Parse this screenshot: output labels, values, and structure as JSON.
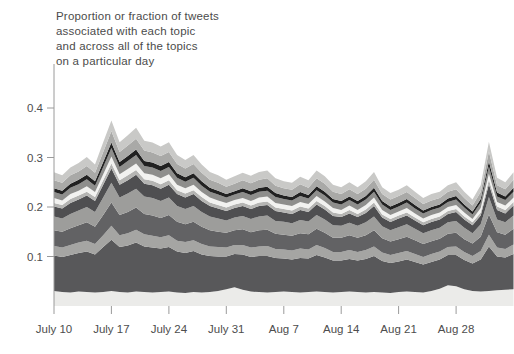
{
  "title": {
    "lines": [
      "Proportion or fraction of tweets",
      "associated with each topic",
      "and across all of the topics",
      "on a particular day"
    ]
  },
  "colors": {
    "background": "#ffffff",
    "axis": "#9a9a9a",
    "tick_label": "#4d4d4d",
    "title_text": "#4b4b4b"
  },
  "chart_data": {
    "type": "area",
    "stacked": true,
    "title": "Proportion or fraction of tweets associated with each topic and across all of the topics on a particular day",
    "xlabel": "",
    "ylabel": "",
    "grid": false,
    "legend_position": "none",
    "ylim": [
      0,
      0.42
    ],
    "yticks": {
      "values": [
        0.1,
        0.2,
        0.3,
        0.4
      ],
      "labels": [
        "0.1",
        "0.2",
        "0.3",
        "0.4"
      ]
    },
    "xticks": {
      "indices": [
        0,
        7,
        14,
        21,
        28,
        35,
        42,
        49
      ],
      "labels": [
        "July 10",
        "July 17",
        "July 24",
        "July 31",
        "Aug 7",
        "Aug 14",
        "Aug 21",
        "Aug 28"
      ]
    },
    "values_unit": "thousandths (divide by 1000 for proportion)",
    "x": [
      "July 10",
      "July 11",
      "July 12",
      "July 13",
      "July 14",
      "July 15",
      "July 16",
      "July 17",
      "July 18",
      "July 19",
      "July 20",
      "July 21",
      "July 22",
      "July 23",
      "July 24",
      "July 25",
      "July 26",
      "July 27",
      "July 28",
      "July 29",
      "July 30",
      "July 31",
      "Aug 1",
      "Aug 2",
      "Aug 3",
      "Aug 4",
      "Aug 5",
      "Aug 6",
      "Aug 7",
      "Aug 8",
      "Aug 9",
      "Aug 10",
      "Aug 11",
      "Aug 12",
      "Aug 13",
      "Aug 14",
      "Aug 15",
      "Aug 16",
      "Aug 17",
      "Aug 18",
      "Aug 19",
      "Aug 20",
      "Aug 21",
      "Aug 22",
      "Aug 23",
      "Aug 24",
      "Aug 25",
      "Aug 26",
      "Aug 27",
      "Aug 28",
      "Aug 29",
      "Aug 30",
      "Aug 31",
      "Sep 1",
      "Sep 2",
      "Sep 3",
      "Sep 4"
    ],
    "series": [
      {
        "name": "topic-band-01-bottom",
        "color": "#ebebe9",
        "values": [
          30,
          28,
          27,
          29,
          28,
          27,
          28,
          30,
          28,
          27,
          29,
          28,
          27,
          28,
          29,
          27,
          26,
          28,
          27,
          28,
          30,
          34,
          38,
          33,
          29,
          28,
          27,
          28,
          29,
          28,
          27,
          28,
          29,
          28,
          27,
          28,
          29,
          28,
          27,
          28,
          27,
          26,
          28,
          29,
          28,
          27,
          30,
          35,
          42,
          40,
          34,
          30,
          29,
          30,
          32,
          33,
          34
        ]
      },
      {
        "name": "topic-band-02",
        "color": "#58585a",
        "values": [
          72,
          71,
          76,
          78,
          82,
          77,
          91,
          104,
          91,
          95,
          99,
          92,
          91,
          88,
          90,
          83,
          81,
          83,
          77,
          73,
          70,
          66,
          67,
          71,
          70,
          73,
          74,
          69,
          67,
          66,
          70,
          68,
          74,
          70,
          65,
          64,
          66,
          64,
          68,
          73,
          64,
          61,
          62,
          65,
          61,
          57,
          59,
          59,
          61,
          63,
          59,
          56,
          65,
          90,
          68,
          65,
          71
        ]
      },
      {
        "name": "topic-band-03",
        "color": "#a5a5a3",
        "values": [
          19,
          19,
          20,
          21,
          22,
          21,
          24,
          28,
          24,
          25,
          26,
          25,
          24,
          23,
          24,
          22,
          22,
          22,
          21,
          19,
          19,
          18,
          18,
          19,
          19,
          19,
          20,
          18,
          18,
          18,
          19,
          18,
          20,
          19,
          17,
          17,
          18,
          17,
          18,
          19,
          17,
          16,
          17,
          17,
          16,
          15,
          16,
          16,
          16,
          17,
          16,
          15,
          17,
          24,
          18,
          17,
          19
        ]
      },
      {
        "name": "topic-band-04",
        "color": "#626264",
        "values": [
          32,
          32,
          34,
          35,
          37,
          35,
          41,
          47,
          41,
          43,
          45,
          41,
          41,
          39,
          41,
          38,
          36,
          37,
          35,
          33,
          31,
          30,
          30,
          32,
          31,
          33,
          33,
          31,
          30,
          30,
          31,
          31,
          33,
          31,
          29,
          29,
          30,
          29,
          30,
          33,
          29,
          27,
          28,
          29,
          28,
          26,
          26,
          26,
          27,
          28,
          26,
          25,
          29,
          41,
          31,
          29,
          32
        ]
      },
      {
        "name": "topic-band-05",
        "color": "#9d9d9b",
        "values": [
          28,
          27,
          29,
          30,
          31,
          30,
          35,
          40,
          35,
          37,
          38,
          35,
          35,
          34,
          35,
          32,
          31,
          32,
          30,
          28,
          27,
          25,
          26,
          27,
          27,
          28,
          29,
          26,
          26,
          25,
          27,
          26,
          28,
          27,
          25,
          24,
          25,
          24,
          26,
          28,
          24,
          23,
          24,
          25,
          23,
          22,
          22,
          22,
          23,
          24,
          23,
          21,
          25,
          35,
          26,
          25,
          27
        ]
      },
      {
        "name": "topic-band-06",
        "color": "#4f4f51",
        "values": [
          20,
          20,
          22,
          22,
          23,
          22,
          26,
          29,
          26,
          27,
          28,
          26,
          26,
          25,
          26,
          24,
          23,
          24,
          22,
          21,
          20,
          19,
          19,
          20,
          20,
          21,
          21,
          20,
          19,
          19,
          20,
          19,
          21,
          20,
          19,
          18,
          19,
          18,
          19,
          21,
          18,
          17,
          18,
          18,
          17,
          16,
          17,
          17,
          17,
          18,
          17,
          16,
          18,
          26,
          19,
          18,
          20
        ]
      },
      {
        "name": "topic-band-07",
        "color": "#b5b5b3",
        "values": [
          7,
          7,
          8,
          8,
          8,
          8,
          9,
          10,
          9,
          10,
          10,
          9,
          9,
          9,
          9,
          8,
          8,
          8,
          8,
          7,
          7,
          7,
          7,
          7,
          7,
          7,
          7,
          7,
          7,
          7,
          7,
          7,
          7,
          7,
          7,
          6,
          7,
          6,
          7,
          7,
          6,
          6,
          6,
          6,
          6,
          6,
          6,
          6,
          6,
          6,
          6,
          6,
          6,
          9,
          7,
          7,
          7
        ]
      },
      {
        "name": "topic-band-08-white",
        "color": "#f2f2f0",
        "values": [
          10,
          9,
          10,
          10,
          11,
          10,
          12,
          14,
          12,
          13,
          13,
          12,
          12,
          12,
          12,
          11,
          11,
          11,
          10,
          10,
          9,
          9,
          9,
          9,
          9,
          10,
          10,
          9,
          9,
          9,
          9,
          9,
          10,
          9,
          9,
          8,
          9,
          8,
          9,
          10,
          9,
          8,
          8,
          9,
          8,
          8,
          8,
          8,
          8,
          8,
          8,
          7,
          9,
          12,
          9,
          9,
          9
        ]
      },
      {
        "name": "topic-band-09",
        "color": "#8e8e8c",
        "values": [
          12,
          12,
          13,
          13,
          14,
          13,
          15,
          17,
          15,
          16,
          17,
          15,
          15,
          15,
          15,
          14,
          13,
          14,
          13,
          12,
          12,
          11,
          11,
          12,
          12,
          12,
          12,
          12,
          11,
          11,
          12,
          11,
          12,
          12,
          11,
          11,
          11,
          11,
          11,
          12,
          11,
          10,
          10,
          11,
          10,
          10,
          10,
          10,
          10,
          11,
          10,
          9,
          11,
          15,
          11,
          11,
          12
        ]
      },
      {
        "name": "topic-band-10-black",
        "color": "#212121",
        "values": [
          8,
          8,
          8,
          9,
          9,
          9,
          10,
          11,
          10,
          10,
          11,
          10,
          10,
          10,
          10,
          9,
          9,
          9,
          9,
          8,
          8,
          7,
          7,
          8,
          8,
          8,
          8,
          8,
          7,
          7,
          8,
          7,
          8,
          8,
          7,
          7,
          7,
          7,
          7,
          8,
          7,
          7,
          7,
          7,
          7,
          6,
          6,
          6,
          7,
          7,
          6,
          6,
          7,
          10,
          8,
          7,
          8
        ]
      },
      {
        "name": "topic-band-11",
        "color": "#a9a9a7",
        "values": [
          16,
          16,
          17,
          17,
          18,
          17,
          20,
          23,
          20,
          21,
          22,
          21,
          20,
          20,
          20,
          19,
          18,
          19,
          17,
          16,
          16,
          15,
          15,
          16,
          16,
          16,
          17,
          15,
          15,
          15,
          16,
          15,
          16,
          16,
          15,
          14,
          15,
          14,
          15,
          16,
          14,
          14,
          14,
          14,
          14,
          13,
          13,
          13,
          14,
          14,
          13,
          12,
          14,
          20,
          15,
          15,
          16
        ]
      },
      {
        "name": "topic-band-12-top",
        "color": "#c9c9c7",
        "values": [
          16,
          15,
          16,
          17,
          18,
          17,
          20,
          22,
          20,
          21,
          22,
          20,
          20,
          19,
          20,
          18,
          17,
          18,
          17,
          16,
          15,
          14,
          15,
          15,
          15,
          16,
          16,
          15,
          14,
          14,
          15,
          15,
          16,
          15,
          14,
          14,
          14,
          14,
          15,
          16,
          14,
          13,
          13,
          14,
          13,
          12,
          13,
          13,
          13,
          14,
          13,
          12,
          14,
          20,
          15,
          14,
          15
        ]
      }
    ]
  }
}
